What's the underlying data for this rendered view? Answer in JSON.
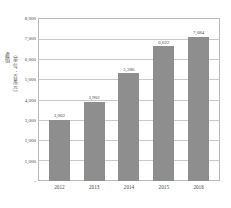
{
  "chart_data": {
    "type": "bar",
    "title": "",
    "xlabel": "",
    "ylabel": "產值（單位：百萬元）",
    "ylabel_main": "產值",
    "ylabel_unit": "（單位：百萬元）",
    "categories": [
      "2012",
      "2013",
      "2014",
      "2015",
      "2016"
    ],
    "values": [
      3002,
      3902,
      5286,
      6622,
      7084
    ],
    "value_labels": [
      "3,002",
      "3,902",
      "5,286",
      "6,622",
      "7,084"
    ],
    "ylim": [
      0,
      8000
    ],
    "ytick_values": [
      8000,
      7000,
      6000,
      5000,
      4000,
      3000,
      2000,
      1000,
      0
    ],
    "ytick_labels": [
      "8,000",
      "7,000",
      "6,000",
      "5,000",
      "4,000",
      "3,000",
      "2,000",
      "1,000",
      "-"
    ],
    "grid": true,
    "legend": false,
    "bar_color": "#8e8e8e",
    "grid_color": "#c9c9c9",
    "frame_color": "#b9b9b9",
    "text_color": "#4a4a4a",
    "series": [
      {
        "name": "產值",
        "values": [
          3002,
          3902,
          5286,
          6622,
          7084
        ]
      }
    ]
  }
}
